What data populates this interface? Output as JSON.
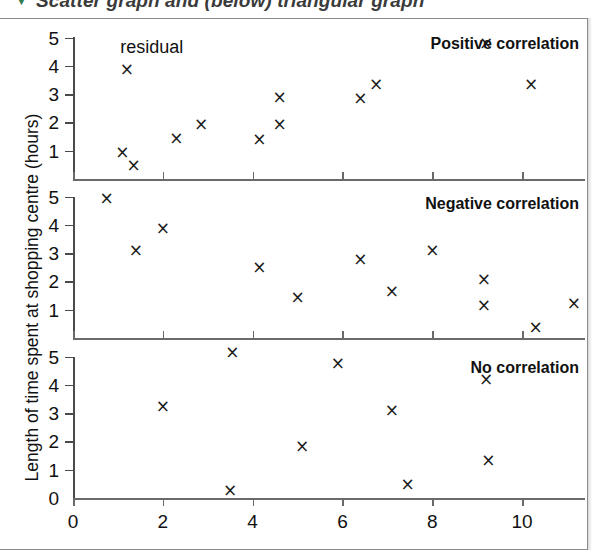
{
  "caption": {
    "marker": "▼",
    "text": "Scatter graph and (below) triangular graph"
  },
  "chart_data": {
    "type": "scatter",
    "title": "Scatter graph and (below) triangular graph",
    "ylabel": "Length of time spent at shopping centre (hours)",
    "xlabel": "",
    "xlim": [
      0,
      11.4
    ],
    "ylim": [
      0,
      5.3
    ],
    "xticks": [
      0,
      2,
      4,
      6,
      8,
      10
    ],
    "xticklabels": [
      "0",
      "2",
      "4",
      "6",
      "8",
      "10"
    ],
    "xminorticks": [
      1,
      3,
      5,
      7,
      9,
      11
    ],
    "grid": false,
    "legend": "none",
    "marker_symbol": "×",
    "panels": [
      {
        "title": "Positive correlation",
        "yticks": [
          1,
          2,
          3,
          4,
          5
        ],
        "yticklabels": [
          "1",
          "2",
          "3",
          "4",
          "5"
        ],
        "annotations": [
          {
            "text": "residual",
            "x": 1.05,
            "y": 4.65
          }
        ],
        "points": [
          {
            "x": 1.2,
            "y": 3.9
          },
          {
            "x": 1.1,
            "y": 0.95
          },
          {
            "x": 1.35,
            "y": 0.5
          },
          {
            "x": 2.3,
            "y": 1.45
          },
          {
            "x": 2.85,
            "y": 1.95
          },
          {
            "x": 4.15,
            "y": 1.4
          },
          {
            "x": 4.6,
            "y": 2.9
          },
          {
            "x": 4.6,
            "y": 1.95
          },
          {
            "x": 6.4,
            "y": 2.85
          },
          {
            "x": 6.75,
            "y": 3.35
          },
          {
            "x": 9.2,
            "y": 4.8
          },
          {
            "x": 10.2,
            "y": 3.35
          }
        ]
      },
      {
        "title": "Negative correlation",
        "yticks": [
          1,
          2,
          3,
          4,
          5
        ],
        "yticklabels": [
          "1",
          "2",
          "3",
          "4",
          "5"
        ],
        "annotations": [],
        "points": [
          {
            "x": 0.75,
            "y": 4.95
          },
          {
            "x": 1.4,
            "y": 3.1
          },
          {
            "x": 2.0,
            "y": 3.9
          },
          {
            "x": 4.15,
            "y": 2.5
          },
          {
            "x": 5.0,
            "y": 1.45
          },
          {
            "x": 6.4,
            "y": 2.78
          },
          {
            "x": 7.1,
            "y": 1.65
          },
          {
            "x": 8.0,
            "y": 3.1
          },
          {
            "x": 9.15,
            "y": 2.1
          },
          {
            "x": 9.15,
            "y": 1.15
          },
          {
            "x": 10.3,
            "y": 0.4
          },
          {
            "x": 11.15,
            "y": 1.25
          }
        ]
      },
      {
        "title": "No correlation",
        "yticks": [
          0,
          1,
          2,
          3,
          4,
          5
        ],
        "yticklabels": [
          "0",
          "1",
          "2",
          "3",
          "4",
          "5"
        ],
        "annotations": [],
        "points": [
          {
            "x": 2.0,
            "y": 3.25
          },
          {
            "x": 3.55,
            "y": 5.15
          },
          {
            "x": 3.5,
            "y": 0.3
          },
          {
            "x": 5.1,
            "y": 1.82
          },
          {
            "x": 5.9,
            "y": 4.78
          },
          {
            "x": 7.1,
            "y": 3.1
          },
          {
            "x": 7.45,
            "y": 0.48
          },
          {
            "x": 9.2,
            "y": 4.2
          },
          {
            "x": 9.25,
            "y": 1.35
          }
        ]
      }
    ]
  }
}
